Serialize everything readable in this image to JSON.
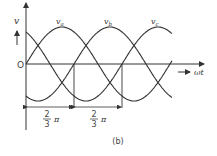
{
  "diagram": {
    "axis": {
      "y_label": "v",
      "x_label": "ωt",
      "origin_label": "O"
    },
    "curves": [
      {
        "name": "v_a",
        "label_main": "v",
        "label_sub": "a",
        "phase_deg": 0
      },
      {
        "name": "v_b",
        "label_main": "v",
        "label_sub": "b",
        "phase_deg": -120
      },
      {
        "name": "v_c",
        "label_main": "v",
        "label_sub": "c",
        "phase_deg": -240
      }
    ],
    "dimensions": [
      {
        "num": "2",
        "den": "3",
        "sym": "π"
      },
      {
        "num": "2",
        "den": "3",
        "sym": "π"
      }
    ],
    "caption": "(b)"
  }
}
